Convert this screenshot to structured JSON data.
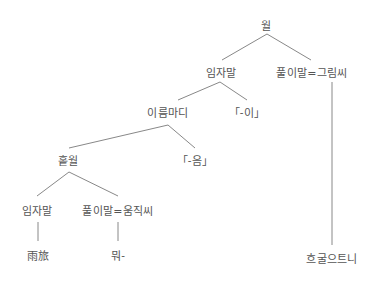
{
  "diagram": {
    "type": "syntax-tree",
    "line_color": "#888888",
    "text_color": "#555555",
    "nodes": [
      {
        "id": "root",
        "label": "월",
        "x": 266,
        "y": 25
      },
      {
        "id": "subject",
        "label": "임자말",
        "x": 221,
        "y": 72
      },
      {
        "id": "predicate-adjective",
        "label": "풀이말=그림씨",
        "x": 312,
        "y": 72
      },
      {
        "id": "noun-clause",
        "label": "이름마디",
        "x": 168,
        "y": 112
      },
      {
        "id": "particle-i",
        "label": "「-이」",
        "x": 247,
        "y": 112
      },
      {
        "id": "simple-sentence",
        "label": "홑월",
        "x": 68,
        "y": 160
      },
      {
        "id": "suffix-eum",
        "label": "「-음」",
        "x": 195,
        "y": 160
      },
      {
        "id": "inner-subject",
        "label": "임자말",
        "x": 37,
        "y": 210
      },
      {
        "id": "predicate-verb",
        "label": "풀이말=움직씨",
        "x": 118,
        "y": 210
      },
      {
        "id": "leaf-rain",
        "label": "雨旅",
        "x": 38,
        "y": 255
      },
      {
        "id": "leaf-verb",
        "label": "뭐-",
        "x": 118,
        "y": 255
      },
      {
        "id": "leaf-adjective",
        "label": "흐굴으트니",
        "x": 332,
        "y": 258
      }
    ],
    "edges": [
      {
        "x1": 267,
        "y1": 34,
        "x2": 222,
        "y2": 60
      },
      {
        "x1": 267,
        "y1": 34,
        "x2": 311,
        "y2": 60
      },
      {
        "x1": 220,
        "y1": 82,
        "x2": 178,
        "y2": 100
      },
      {
        "x1": 220,
        "y1": 82,
        "x2": 247,
        "y2": 100
      },
      {
        "x1": 332,
        "y1": 82,
        "x2": 332,
        "y2": 245
      },
      {
        "x1": 168,
        "y1": 125,
        "x2": 69,
        "y2": 148
      },
      {
        "x1": 168,
        "y1": 125,
        "x2": 195,
        "y2": 148
      },
      {
        "x1": 69,
        "y1": 172,
        "x2": 37,
        "y2": 196
      },
      {
        "x1": 69,
        "y1": 172,
        "x2": 118,
        "y2": 196
      },
      {
        "x1": 38,
        "y1": 222,
        "x2": 38,
        "y2": 241
      },
      {
        "x1": 118,
        "y1": 222,
        "x2": 118,
        "y2": 241
      }
    ]
  }
}
